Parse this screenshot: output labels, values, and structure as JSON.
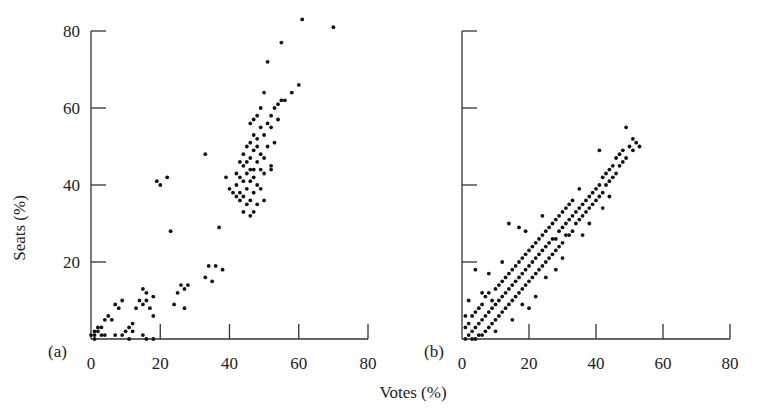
{
  "figure": {
    "ylabel": "Seats (%)",
    "xlabel": "Votes (%)",
    "text_color": "#222222",
    "point_color": "#111111"
  },
  "chart_data": [
    {
      "type": "scatter",
      "panel_label": "(a)",
      "title": "",
      "xlabel": "Votes (%)",
      "ylabel": "Seats (%)",
      "xlim": [
        0,
        80
      ],
      "ylim": [
        0,
        80
      ],
      "xticks": [
        0,
        20,
        40,
        60,
        80
      ],
      "yticks": [
        20,
        40,
        60,
        80
      ],
      "grid": false,
      "legend": null,
      "points": [
        [
          61,
          83
        ],
        [
          70,
          81
        ],
        [
          55,
          77
        ],
        [
          51,
          72
        ],
        [
          58,
          64
        ],
        [
          60,
          66
        ],
        [
          56,
          62
        ],
        [
          54,
          61
        ],
        [
          53,
          60
        ],
        [
          52,
          58
        ],
        [
          54,
          57
        ],
        [
          55,
          62
        ],
        [
          33,
          48
        ],
        [
          50,
          64
        ],
        [
          49,
          60
        ],
        [
          48,
          58
        ],
        [
          52,
          55
        ],
        [
          51,
          56
        ],
        [
          49,
          55
        ],
        [
          47,
          57
        ],
        [
          46,
          56
        ],
        [
          50,
          53
        ],
        [
          48,
          52
        ],
        [
          53,
          51
        ],
        [
          47,
          53
        ],
        [
          46,
          51
        ],
        [
          45,
          50
        ],
        [
          48,
          50
        ],
        [
          51,
          50
        ],
        [
          47,
          49
        ],
        [
          44,
          48
        ],
        [
          49,
          48
        ],
        [
          46,
          47
        ],
        [
          50,
          47
        ],
        [
          45,
          46
        ],
        [
          43,
          46
        ],
        [
          48,
          46
        ],
        [
          52,
          45
        ],
        [
          44,
          45
        ],
        [
          47,
          44
        ],
        [
          46,
          44
        ],
        [
          49,
          44
        ],
        [
          42,
          43
        ],
        [
          45,
          43
        ],
        [
          50,
          43
        ],
        [
          43,
          42
        ],
        [
          47,
          42
        ],
        [
          46,
          41
        ],
        [
          44,
          41
        ],
        [
          48,
          40
        ],
        [
          42,
          40
        ],
        [
          45,
          39
        ],
        [
          49,
          39
        ],
        [
          41,
          38
        ],
        [
          47,
          38
        ],
        [
          44,
          37
        ],
        [
          46,
          36
        ],
        [
          43,
          36
        ],
        [
          48,
          35
        ],
        [
          45,
          35
        ],
        [
          47,
          33
        ],
        [
          44,
          33
        ],
        [
          46,
          32
        ],
        [
          50,
          36
        ],
        [
          52,
          44
        ],
        [
          42,
          37
        ],
        [
          43,
          38
        ],
        [
          39,
          42
        ],
        [
          40,
          39
        ],
        [
          37,
          29
        ],
        [
          19,
          41
        ],
        [
          20,
          40
        ],
        [
          22,
          42
        ],
        [
          23,
          28
        ],
        [
          36,
          19
        ],
        [
          34,
          19
        ],
        [
          38,
          18
        ],
        [
          33,
          16
        ],
        [
          35,
          15
        ],
        [
          26,
          14
        ],
        [
          27,
          13
        ],
        [
          25,
          12
        ],
        [
          28,
          14
        ],
        [
          24,
          9
        ],
        [
          27,
          8
        ],
        [
          15,
          13
        ],
        [
          16,
          12
        ],
        [
          18,
          11
        ],
        [
          14,
          10
        ],
        [
          15,
          9
        ],
        [
          17,
          8
        ],
        [
          16,
          10
        ],
        [
          13,
          8
        ],
        [
          18,
          6
        ],
        [
          7,
          9
        ],
        [
          8,
          8
        ],
        [
          9,
          10
        ],
        [
          5,
          6
        ],
        [
          6,
          5
        ],
        [
          4,
          5
        ],
        [
          3,
          3
        ],
        [
          2,
          2
        ],
        [
          1,
          1
        ],
        [
          1,
          2
        ],
        [
          2,
          3
        ],
        [
          3,
          1
        ],
        [
          0,
          1
        ],
        [
          1,
          0
        ],
        [
          4,
          1
        ],
        [
          7,
          1
        ],
        [
          10,
          2
        ],
        [
          11,
          3
        ],
        [
          12,
          4
        ],
        [
          9,
          1
        ],
        [
          11,
          0
        ],
        [
          15,
          1
        ],
        [
          18,
          0
        ],
        [
          16,
          0
        ],
        [
          12,
          2
        ]
      ]
    },
    {
      "type": "scatter",
      "panel_label": "(b)",
      "title": "",
      "xlabel": "Votes (%)",
      "ylabel": "Seats (%)",
      "xlim": [
        0,
        80
      ],
      "ylim": [
        0,
        80
      ],
      "xticks": [
        0,
        20,
        40,
        60,
        80
      ],
      "yticks": [
        20,
        40,
        60,
        80
      ],
      "grid": false,
      "legend": null,
      "points": [
        [
          49,
          55
        ],
        [
          51,
          52
        ],
        [
          52,
          51
        ],
        [
          50,
          50
        ],
        [
          53,
          50
        ],
        [
          48,
          49
        ],
        [
          51,
          49
        ],
        [
          47,
          48
        ],
        [
          49,
          47
        ],
        [
          46,
          47
        ],
        [
          48,
          46
        ],
        [
          45,
          45
        ],
        [
          41,
          49
        ],
        [
          47,
          45
        ],
        [
          44,
          44
        ],
        [
          46,
          43
        ],
        [
          43,
          43
        ],
        [
          45,
          42
        ],
        [
          42,
          42
        ],
        [
          44,
          41
        ],
        [
          41,
          40
        ],
        [
          43,
          40
        ],
        [
          40,
          39
        ],
        [
          42,
          38
        ],
        [
          39,
          38
        ],
        [
          41,
          37
        ],
        [
          38,
          37
        ],
        [
          40,
          36
        ],
        [
          37,
          36
        ],
        [
          39,
          35
        ],
        [
          42,
          34
        ],
        [
          36,
          35
        ],
        [
          38,
          34
        ],
        [
          35,
          34
        ],
        [
          37,
          33
        ],
        [
          34,
          33
        ],
        [
          36,
          32
        ],
        [
          33,
          32
        ],
        [
          35,
          31
        ],
        [
          32,
          31
        ],
        [
          34,
          30
        ],
        [
          31,
          30
        ],
        [
          30,
          29
        ],
        [
          33,
          28
        ],
        [
          32,
          27
        ],
        [
          29,
          28
        ],
        [
          31,
          27
        ],
        [
          28,
          26
        ],
        [
          30,
          25
        ],
        [
          27,
          26
        ],
        [
          29,
          24
        ],
        [
          26,
          25
        ],
        [
          28,
          23
        ],
        [
          25,
          24
        ],
        [
          27,
          22
        ],
        [
          24,
          23
        ],
        [
          26,
          21
        ],
        [
          23,
          22
        ],
        [
          25,
          20
        ],
        [
          22,
          21
        ],
        [
          24,
          19
        ],
        [
          21,
          20
        ],
        [
          23,
          18
        ],
        [
          20,
          19
        ],
        [
          22,
          17
        ],
        [
          19,
          18
        ],
        [
          21,
          16
        ],
        [
          18,
          17
        ],
        [
          20,
          15
        ],
        [
          17,
          16
        ],
        [
          19,
          14
        ],
        [
          16,
          15
        ],
        [
          18,
          13
        ],
        [
          15,
          14
        ],
        [
          17,
          12
        ],
        [
          14,
          13
        ],
        [
          16,
          11
        ],
        [
          13,
          12
        ],
        [
          15,
          10
        ],
        [
          12,
          11
        ],
        [
          14,
          9
        ],
        [
          11,
          10
        ],
        [
          13,
          8
        ],
        [
          10,
          9
        ],
        [
          12,
          7
        ],
        [
          9,
          8
        ],
        [
          11,
          6
        ],
        [
          8,
          7
        ],
        [
          10,
          5
        ],
        [
          7,
          6
        ],
        [
          9,
          4
        ],
        [
          6,
          5
        ],
        [
          8,
          3
        ],
        [
          5,
          4
        ],
        [
          7,
          2
        ],
        [
          4,
          3
        ],
        [
          6,
          1
        ],
        [
          3,
          2
        ],
        [
          5,
          1
        ],
        [
          2,
          1
        ],
        [
          4,
          0
        ],
        [
          1,
          0
        ],
        [
          3,
          0
        ],
        [
          2,
          4
        ],
        [
          1,
          3
        ],
        [
          3,
          6
        ],
        [
          5,
          8
        ],
        [
          4,
          7
        ],
        [
          6,
          9
        ],
        [
          7,
          11
        ],
        [
          8,
          12
        ],
        [
          9,
          10
        ],
        [
          10,
          13
        ],
        [
          11,
          14
        ],
        [
          12,
          15
        ],
        [
          13,
          16
        ],
        [
          14,
          17
        ],
        [
          15,
          18
        ],
        [
          16,
          19
        ],
        [
          17,
          20
        ],
        [
          18,
          21
        ],
        [
          19,
          22
        ],
        [
          20,
          23
        ],
        [
          21,
          24
        ],
        [
          22,
          25
        ],
        [
          23,
          26
        ],
        [
          24,
          27
        ],
        [
          25,
          28
        ],
        [
          26,
          29
        ],
        [
          27,
          30
        ],
        [
          28,
          31
        ],
        [
          29,
          32
        ],
        [
          30,
          33
        ],
        [
          31,
          34
        ],
        [
          32,
          35
        ],
        [
          33,
          36
        ],
        [
          14,
          30
        ],
        [
          17,
          29
        ],
        [
          19,
          28
        ],
        [
          24,
          32
        ],
        [
          35,
          39
        ],
        [
          12,
          20
        ],
        [
          2,
          10
        ],
        [
          8,
          17
        ],
        [
          4,
          18
        ],
        [
          20,
          8
        ],
        [
          25,
          16
        ],
        [
          30,
          21
        ],
        [
          36,
          27
        ],
        [
          38,
          30
        ],
        [
          44,
          37
        ],
        [
          28,
          18
        ],
        [
          22,
          11
        ],
        [
          1,
          6
        ],
        [
          10,
          2
        ],
        [
          6,
          12
        ],
        [
          15,
          5
        ],
        [
          18,
          9
        ]
      ]
    }
  ]
}
